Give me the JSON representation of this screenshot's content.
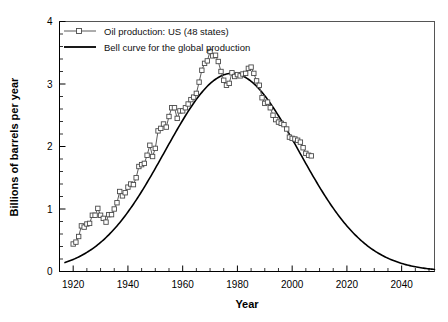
{
  "chart_data": {
    "type": "line",
    "title": "",
    "subtitle": "",
    "xlabel": "Year",
    "ylabel": "Billions of barrels per year",
    "xlim": [
      1915,
      2052
    ],
    "ylim": [
      0,
      4
    ],
    "xticks": [
      1920,
      1940,
      1960,
      1980,
      2000,
      2020,
      2040
    ],
    "xtick_labels": [
      "1920",
      "1940",
      "1960",
      "1980",
      "2000",
      "2020",
      "2040"
    ],
    "xminor_step": 5,
    "yticks": [
      0,
      1,
      2,
      3,
      4
    ],
    "ytick_labels": [
      "0",
      "1",
      "2",
      "3",
      "4"
    ],
    "yminor_step": 0.2,
    "grid": false,
    "legend_position": "top-left",
    "legend": [
      {
        "label": "Oil production: US (48 states)",
        "marker": "square",
        "color": "#5a5a5a"
      },
      {
        "label": "Bell curve for the global production",
        "marker": "none",
        "color": "#000000"
      }
    ],
    "series": [
      {
        "name": "Oil production: US (48 states)",
        "marker": "open-square",
        "color": "#5a5a5a",
        "x": [
          1920,
          1921,
          1922,
          1923,
          1924,
          1925,
          1926,
          1927,
          1928,
          1929,
          1930,
          1931,
          1932,
          1933,
          1934,
          1935,
          1936,
          1937,
          1938,
          1939,
          1940,
          1941,
          1942,
          1943,
          1944,
          1945,
          1946,
          1947,
          1948,
          1949,
          1950,
          1951,
          1952,
          1953,
          1954,
          1955,
          1956,
          1957,
          1958,
          1959,
          1960,
          1961,
          1962,
          1963,
          1964,
          1965,
          1966,
          1967,
          1968,
          1969,
          1970,
          1971,
          1972,
          1973,
          1974,
          1975,
          1976,
          1977,
          1978,
          1979,
          1980,
          1981,
          1982,
          1983,
          1984,
          1985,
          1986,
          1987,
          1988,
          1989,
          1990,
          1991,
          1992,
          1993,
          1994,
          1995,
          1996,
          1997,
          1998,
          1999,
          2000,
          2001,
          2002,
          2003,
          2004,
          2005,
          2006,
          2007
        ],
        "y": [
          0.44,
          0.47,
          0.56,
          0.73,
          0.71,
          0.76,
          0.77,
          0.9,
          0.9,
          1.01,
          0.9,
          0.85,
          0.79,
          0.91,
          0.91,
          1.0,
          1.1,
          1.28,
          1.21,
          1.26,
          1.35,
          1.4,
          1.39,
          1.5,
          1.68,
          1.71,
          1.73,
          1.86,
          2.02,
          1.84,
          1.97,
          2.25,
          2.29,
          2.36,
          2.31,
          2.48,
          2.62,
          2.62,
          2.45,
          2.57,
          2.57,
          2.62,
          2.68,
          2.75,
          2.79,
          2.85,
          3.03,
          3.22,
          3.33,
          3.37,
          3.52,
          3.45,
          3.46,
          3.36,
          3.2,
          3.06,
          2.98,
          3.01,
          3.18,
          3.12,
          3.15,
          3.13,
          3.16,
          3.17,
          3.25,
          3.27,
          3.17,
          3.05,
          2.98,
          2.78,
          2.69,
          2.71,
          2.62,
          2.5,
          2.43,
          2.39,
          2.37,
          2.35,
          2.28,
          2.15,
          2.13,
          2.12,
          2.1,
          2.07,
          1.98,
          1.89,
          1.86,
          1.85
        ]
      },
      {
        "name": "Bell curve for the global production",
        "marker": "none",
        "color": "#000000",
        "peak_year": 1978,
        "peak_value": 3.17,
        "width_sigma": 24.5,
        "x_start": 1917,
        "x_end": 2052,
        "end_value": 0.2
      }
    ],
    "annotations": []
  }
}
